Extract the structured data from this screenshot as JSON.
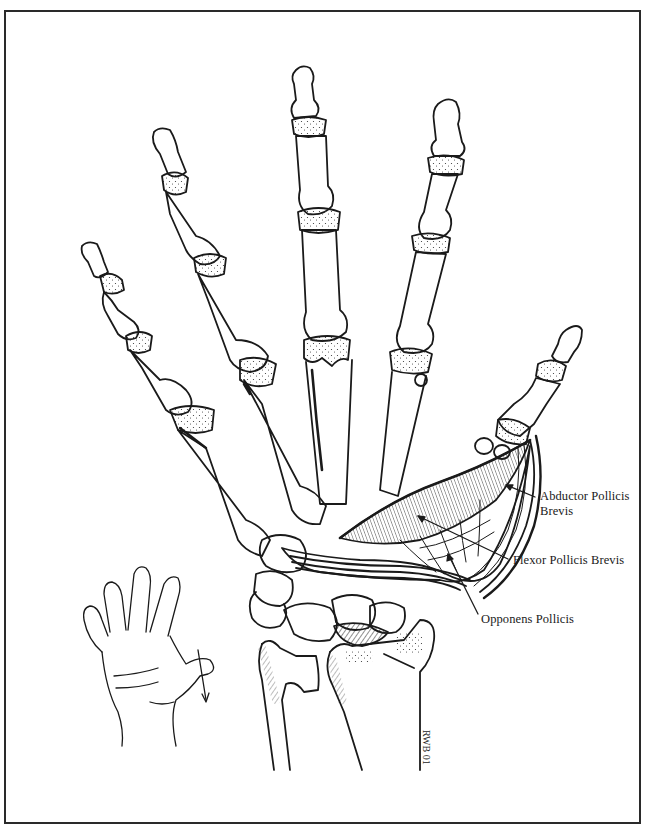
{
  "figure": {
    "labels": {
      "abductor_line1": "Abductor Pollicis",
      "abductor_line2": "Brevis",
      "flexor": "Flexor Pollicis Brevis",
      "opponens": "Opponens Pollicis"
    },
    "signature": "RWB",
    "signature_year": "01",
    "inset": "hand-outline-thumb-opposition-arrow"
  },
  "colors": {
    "ink": "#1a1a1a",
    "paper": "#ffffff",
    "frame": "#2a2a2a"
  }
}
